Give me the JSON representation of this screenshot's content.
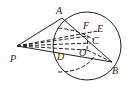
{
  "diagram": {
    "type": "geometry",
    "points": {
      "P": {
        "label": "P",
        "x": 16,
        "y": 47
      },
      "A": {
        "label": "A",
        "x": 63,
        "y": 17
      },
      "B": {
        "label": "B",
        "x": 112,
        "y": 62
      },
      "C": {
        "label": "C",
        "x": 90,
        "y": 41
      },
      "D": {
        "label": "D",
        "x": 55,
        "y": 54
      },
      "E": {
        "label": "E",
        "x": 97,
        "y": 30
      },
      "F": {
        "label": "F",
        "x": 87,
        "y": 34
      },
      "O": {
        "label": "O",
        "x": 87,
        "y": 48
      }
    },
    "circle": {
      "cx": 87,
      "cy": 46,
      "r": 34
    }
  }
}
